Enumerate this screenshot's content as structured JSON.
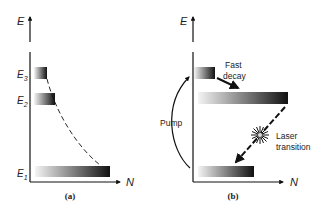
{
  "panel_a": {
    "axis_y_label": "E",
    "axis_x_label": "N",
    "caption": "(a)",
    "levels": [
      {
        "name": "E",
        "sub": "3"
      },
      {
        "name": "E",
        "sub": "2"
      },
      {
        "name": "E",
        "sub": "1"
      }
    ]
  },
  "panel_b": {
    "axis_y_label": "E",
    "axis_x_label": "N",
    "caption": "(b)",
    "pump_label": "Pump",
    "fast_decay_line1": "Fast",
    "fast_decay_line2": "decay",
    "laser_line1": "Laser",
    "laser_line2": "transition"
  },
  "colors": {
    "ink": "#111111",
    "bar_light": "#f4f4f4",
    "bar_dark": "#111111"
  }
}
